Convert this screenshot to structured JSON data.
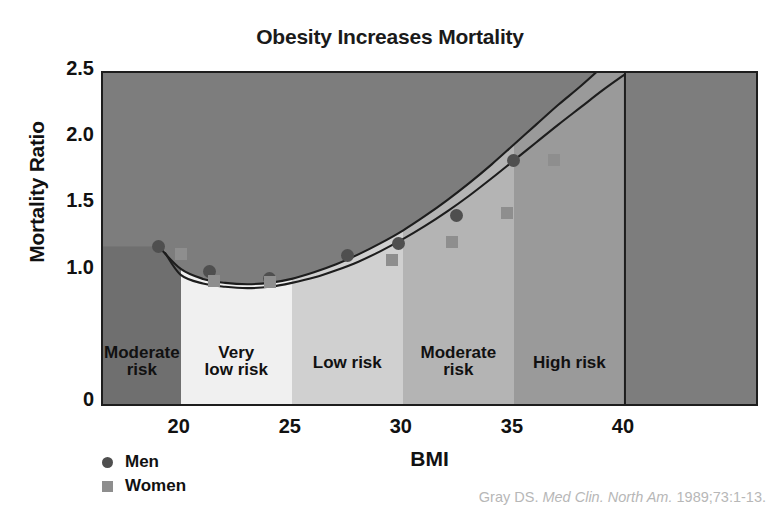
{
  "chart_data": {
    "type": "scatter",
    "title": "Obesity Increases Mortality",
    "xlabel": "BMI",
    "ylabel": "Mortality Ratio",
    "xlim": [
      16.5,
      45.9
    ],
    "ylim": [
      0,
      2.5
    ],
    "grid": false,
    "legend_position": "below-left",
    "xticks": [
      20,
      25,
      30,
      35,
      40
    ],
    "xtick_labels": [
      "20",
      "25",
      "30",
      "35",
      "40"
    ],
    "yticks": [
      1.0,
      1.5,
      2.0,
      2.5
    ],
    "ytick_labels": [
      "1.0",
      "1.5",
      "2.0",
      "2.5"
    ],
    "y_origin_label": "0",
    "series": [
      {
        "name": "Men",
        "marker": "circle",
        "color": "#4f4f4f",
        "x": [
          19.0,
          21.3,
          24.0,
          27.5,
          29.8,
          32.4,
          35.0
        ],
        "y": [
          1.19,
          1.0,
          0.95,
          1.12,
          1.21,
          1.42,
          1.84
        ]
      },
      {
        "name": "Women",
        "marker": "square",
        "color": "#8e8e8e",
        "x": [
          20.0,
          21.5,
          24.0,
          29.5,
          32.2,
          34.7,
          36.8
        ],
        "y": [
          1.13,
          0.93,
          0.92,
          1.09,
          1.22,
          1.44,
          1.84
        ]
      }
    ],
    "curves": [
      {
        "name": "men-trend",
        "color": "#1d1d1d",
        "points": [
          [
            19.0,
            1.19
          ],
          [
            20.0,
            1.02
          ],
          [
            21.0,
            0.945
          ],
          [
            22.0,
            0.915
          ],
          [
            23.0,
            0.905
          ],
          [
            24.0,
            0.915
          ],
          [
            25.0,
            0.945
          ],
          [
            26.0,
            0.995
          ],
          [
            27.0,
            1.055
          ],
          [
            28.0,
            1.13
          ],
          [
            29.0,
            1.215
          ],
          [
            30.0,
            1.31
          ],
          [
            31.0,
            1.42
          ],
          [
            32.0,
            1.54
          ],
          [
            33.0,
            1.67
          ],
          [
            34.0,
            1.81
          ],
          [
            35.0,
            1.96
          ],
          [
            36.0,
            2.11
          ],
          [
            37.0,
            2.26
          ],
          [
            38.0,
            2.4
          ],
          [
            39.0,
            2.55
          ],
          [
            40.0,
            2.68
          ]
        ]
      },
      {
        "name": "women-trend",
        "color": "#1d1d1d",
        "points": [
          [
            19.3,
            1.14
          ],
          [
            20.0,
            0.975
          ],
          [
            21.0,
            0.91
          ],
          [
            22.0,
            0.885
          ],
          [
            23.0,
            0.875
          ],
          [
            24.0,
            0.885
          ],
          [
            25.0,
            0.915
          ],
          [
            26.0,
            0.955
          ],
          [
            27.0,
            1.01
          ],
          [
            28.0,
            1.075
          ],
          [
            29.0,
            1.155
          ],
          [
            30.0,
            1.245
          ],
          [
            31.0,
            1.345
          ],
          [
            32.0,
            1.455
          ],
          [
            33.0,
            1.575
          ],
          [
            34.0,
            1.705
          ],
          [
            35.0,
            1.84
          ],
          [
            36.0,
            1.975
          ],
          [
            37.0,
            2.11
          ],
          [
            38.0,
            2.24
          ],
          [
            39.0,
            2.37
          ],
          [
            40.0,
            2.49
          ]
        ]
      }
    ],
    "risk_bands": [
      {
        "label_lines": [
          "Moderate",
          "risk"
        ],
        "bmi_start": 16.5,
        "bmi_end": 20.0,
        "color": "#6f6f6f"
      },
      {
        "label_lines": [
          "Very",
          "low risk"
        ],
        "bmi_start": 20.0,
        "bmi_end": 25.0,
        "color": "#f0f0f0"
      },
      {
        "label_lines": [
          "Low risk"
        ],
        "bmi_start": 25.0,
        "bmi_end": 30.0,
        "color": "#d0d0d0"
      },
      {
        "label_lines": [
          "Moderate",
          "risk"
        ],
        "bmi_start": 30.0,
        "bmi_end": 35.0,
        "color": "#b4b4b4"
      },
      {
        "label_lines": [
          "High risk"
        ],
        "bmi_start": 35.0,
        "bmi_end": 40.0,
        "color": "#9a9a9a"
      },
      {
        "label_lines": [
          "Very",
          "high risk"
        ],
        "bmi_start": 40.0,
        "bmi_end": 45.9,
        "color": "#7d7d7d"
      }
    ],
    "upper_region_color": "#7d7d7d",
    "plot_border_color": "#1d1d1d"
  },
  "legend": {
    "items": [
      {
        "label": "Men",
        "marker": "circle-marker"
      },
      {
        "label": "Women",
        "marker": "square-marker"
      }
    ]
  },
  "citation": {
    "author": "Gray DS.",
    "journal": "Med Clin. North Am.",
    "locator": "1989;73:1-13."
  }
}
